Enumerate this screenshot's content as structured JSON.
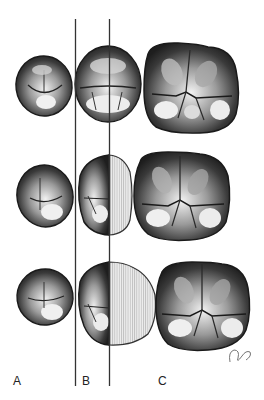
{
  "figure": {
    "labels": {
      "a": "A",
      "b": "B",
      "c": "C"
    },
    "signature": "DHB",
    "rows": [
      {
        "name": "row-1",
        "description": "complete premolar B and molar C"
      },
      {
        "name": "row-2",
        "description": "premolar B distal half replaced by hatched outline"
      },
      {
        "name": "row-3",
        "description": "premolar B distal half replaced by larger hatched outline"
      }
    ],
    "colors": {
      "line": "#333333",
      "tooth_dark": "#2a2a2a",
      "tooth_mid": "#7a7a7a",
      "tooth_light": "#e6e6e6",
      "hatch": "#d9d9d9",
      "background": "#ffffff"
    }
  }
}
